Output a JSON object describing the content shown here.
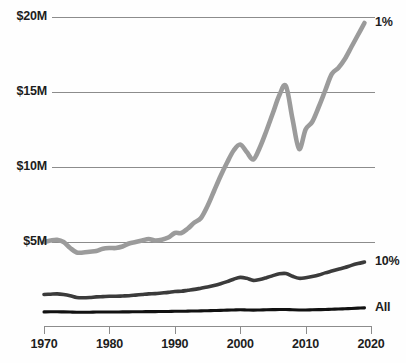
{
  "chart_data": {
    "type": "line",
    "title": "",
    "subtitle": "",
    "xlabel": "",
    "ylabel": "",
    "grid": "horizontal",
    "legend_position": "right-inline",
    "xlim": [
      1970,
      2020
    ],
    "ylim": [
      0,
      20
    ],
    "y_unit": "millions of dollars",
    "xticks": [
      1970,
      1980,
      1990,
      2000,
      2010,
      2020
    ],
    "xtick_labels": [
      "1970",
      "1980",
      "1990",
      "2000",
      "2010",
      "2020"
    ],
    "yticks": [
      5,
      10,
      15,
      20
    ],
    "ytick_labels": [
      "$5M",
      "$10M",
      "$15M",
      "$20M"
    ],
    "series": [
      {
        "name": "1%",
        "label": "1%",
        "color": "#9b9b9b",
        "width": 4.6,
        "x": [
          1970,
          1971,
          1972,
          1973,
          1974,
          1975,
          1976,
          1977,
          1978,
          1979,
          1980,
          1981,
          1982,
          1983,
          1984,
          1985,
          1986,
          1987,
          1988,
          1989,
          1990,
          1991,
          1992,
          1993,
          1994,
          1995,
          1996,
          1997,
          1998,
          1999,
          2000,
          2001,
          2002,
          2003,
          2004,
          2005,
          2006,
          2007,
          2008,
          2009,
          2010,
          2011,
          2012,
          2013,
          2014,
          2015,
          2016,
          2017,
          2018,
          2019
        ],
        "values": [
          5.0,
          5.1,
          5.15,
          5.0,
          4.6,
          4.3,
          4.3,
          4.35,
          4.4,
          4.55,
          4.6,
          4.6,
          4.7,
          4.9,
          5.0,
          5.1,
          5.2,
          5.1,
          5.15,
          5.3,
          5.6,
          5.6,
          5.9,
          6.3,
          6.6,
          7.4,
          8.4,
          9.4,
          10.3,
          11.1,
          11.5,
          11.0,
          10.5,
          11.3,
          12.4,
          13.6,
          14.8,
          15.4,
          13.2,
          11.2,
          12.5,
          13.0,
          14.0,
          15.1,
          16.2,
          16.6,
          17.2,
          18.0,
          18.8,
          19.6
        ]
      },
      {
        "name": "10%",
        "label": "10%",
        "color": "#3b3b3b",
        "width": 3.6,
        "x": [
          1970,
          1971,
          1972,
          1973,
          1974,
          1975,
          1976,
          1977,
          1978,
          1979,
          1980,
          1981,
          1982,
          1983,
          1984,
          1985,
          1986,
          1987,
          1988,
          1989,
          1990,
          1991,
          1992,
          1993,
          1994,
          1995,
          1996,
          1997,
          1998,
          1999,
          2000,
          2001,
          2002,
          2003,
          2004,
          2005,
          2006,
          2007,
          2008,
          2009,
          2010,
          2011,
          2012,
          2013,
          2014,
          2015,
          2016,
          2017,
          2018,
          2019
        ],
        "values": [
          1.5,
          1.52,
          1.54,
          1.5,
          1.42,
          1.3,
          1.28,
          1.3,
          1.34,
          1.36,
          1.38,
          1.38,
          1.4,
          1.42,
          1.46,
          1.5,
          1.54,
          1.56,
          1.6,
          1.64,
          1.7,
          1.72,
          1.78,
          1.84,
          1.92,
          2.0,
          2.1,
          2.22,
          2.36,
          2.52,
          2.64,
          2.58,
          2.44,
          2.5,
          2.62,
          2.76,
          2.88,
          2.9,
          2.72,
          2.58,
          2.62,
          2.7,
          2.8,
          2.94,
          3.06,
          3.18,
          3.3,
          3.44,
          3.56,
          3.66
        ]
      },
      {
        "name": "All",
        "label": "All",
        "color": "#111111",
        "width": 3.1,
        "x": [
          1970,
          1971,
          1972,
          1973,
          1974,
          1975,
          1976,
          1977,
          1978,
          1979,
          1980,
          1981,
          1982,
          1983,
          1984,
          1985,
          1986,
          1987,
          1988,
          1989,
          1990,
          1991,
          1992,
          1993,
          1994,
          1995,
          1996,
          1997,
          1998,
          1999,
          2000,
          2001,
          2002,
          2003,
          2004,
          2005,
          2006,
          2007,
          2008,
          2009,
          2010,
          2011,
          2012,
          2013,
          2014,
          2015,
          2016,
          2017,
          2018,
          2019
        ],
        "values": [
          0.34,
          0.35,
          0.35,
          0.34,
          0.33,
          0.32,
          0.32,
          0.32,
          0.33,
          0.33,
          0.33,
          0.33,
          0.34,
          0.34,
          0.35,
          0.35,
          0.36,
          0.36,
          0.37,
          0.37,
          0.38,
          0.38,
          0.39,
          0.4,
          0.41,
          0.42,
          0.43,
          0.44,
          0.46,
          0.47,
          0.48,
          0.47,
          0.46,
          0.47,
          0.48,
          0.49,
          0.5,
          0.5,
          0.48,
          0.47,
          0.47,
          0.48,
          0.49,
          0.5,
          0.52,
          0.53,
          0.55,
          0.57,
          0.59,
          0.61
        ]
      }
    ],
    "series_labels": [
      {
        "text": "1%",
        "at_x": 2020,
        "at_y": 19.6
      },
      {
        "text": "10%",
        "at_x": 2020,
        "at_y": 3.66
      },
      {
        "text": "All",
        "at_x": 2020,
        "at_y": 0.61
      }
    ],
    "colors": {
      "gridline": "#8c8c8c",
      "axis": "#8c8c8c",
      "background": "#fefefe",
      "text": "#1d1d1d"
    }
  }
}
